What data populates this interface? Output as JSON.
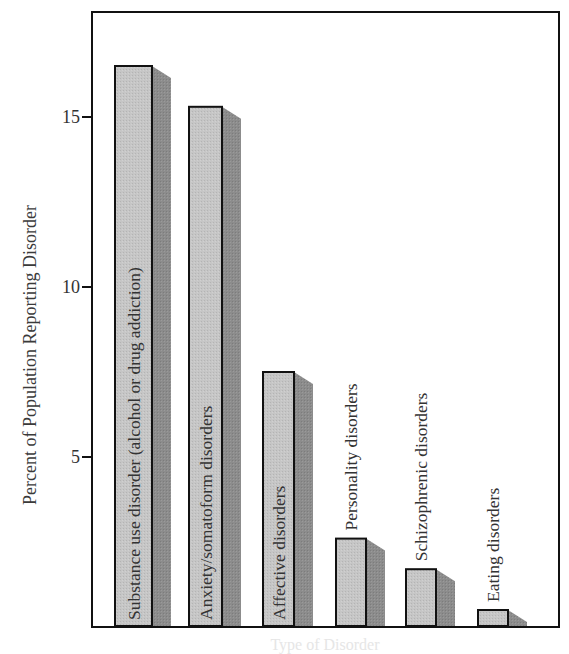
{
  "chart_data": {
    "type": "bar",
    "title": "",
    "xlabel": "Type of Disorder",
    "ylabel": "Percent of Population Reporting Disorder",
    "ylim": [
      0,
      17.9
    ],
    "yticks": [
      5,
      10,
      15
    ],
    "grid": false,
    "legend": null,
    "categories": [
      "Substance use disorder (alcohol or drug addiction)",
      "Anxiety/somatoform disorders",
      "Affective disorders",
      "Personality disorders",
      "Schizophrenic disorders",
      "Eating disorders"
    ],
    "values": [
      16.5,
      15.3,
      7.5,
      2.6,
      1.7,
      0.5
    ],
    "label_positions": [
      "inside",
      "inside",
      "inside",
      "above",
      "above",
      "above"
    ],
    "colors": {
      "bar_face": "#c4c4c4",
      "bar_shadow": "#8a8a8a",
      "bar_outline": "#111111",
      "axis": "#111111",
      "text": "#333333"
    }
  }
}
